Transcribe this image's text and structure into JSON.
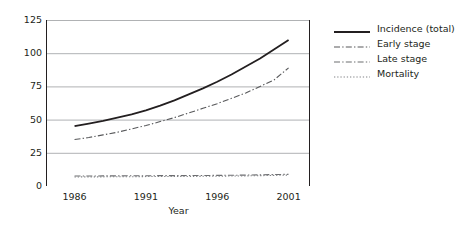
{
  "chart_data": {
    "type": "line",
    "title": "",
    "xlabel": "Year",
    "ylabel": "Rate per 100 000 population",
    "xlim": [
      1984,
      2002.5
    ],
    "ylim": [
      0,
      125
    ],
    "yticks": [
      0,
      25,
      50,
      75,
      100,
      125
    ],
    "ytick_labels": [
      "0",
      "25",
      "50",
      "75",
      "100",
      "125"
    ],
    "xticks": [
      1986,
      1991,
      1996,
      2001
    ],
    "xtick_labels": [
      "1986",
      "1991",
      "1996",
      "2001"
    ],
    "xminor_ticks": [
      1988.5,
      1993.5,
      1998.5
    ],
    "grid": "horizontal",
    "legend_position": "right",
    "x": [
      1986,
      1987,
      1988,
      1989,
      1990,
      1991,
      1992,
      1993,
      1994,
      1995,
      1996,
      1997,
      1998,
      1999,
      2000,
      2001
    ],
    "series": [
      {
        "name": "Incidence (total)",
        "style": "solid",
        "color": "#231f20",
        "values": [
          45,
          47,
          49,
          51.5,
          54,
          57,
          60.5,
          64.5,
          69,
          73.5,
          78.5,
          84,
          90,
          96,
          103,
          110
        ]
      },
      {
        "name": "Early stage",
        "style": "dash-dot",
        "color": "#58595b",
        "values": [
          35,
          36.5,
          38.5,
          40.5,
          43,
          45.5,
          48.5,
          51.5,
          55,
          58.5,
          62,
          66,
          70,
          75,
          80,
          89
        ]
      },
      {
        "name": "Late stage",
        "style": "dash-dot",
        "color": "#6d6e71",
        "values": [
          7.5,
          7.5,
          7.6,
          7.6,
          7.7,
          7.7,
          7.8,
          7.8,
          7.9,
          7.9,
          8.0,
          8.1,
          8.2,
          8.4,
          8.6,
          8.8
        ]
      },
      {
        "name": "Mortality",
        "style": "dotted",
        "color": "#808285",
        "values": [
          6.8,
          6.9,
          6.9,
          7.0,
          7.0,
          7.1,
          7.1,
          7.2,
          7.2,
          7.3,
          7.4,
          7.5,
          7.6,
          7.8,
          8.0,
          8.2
        ]
      }
    ]
  },
  "legend": {
    "items": [
      {
        "label": "Incidence (total)",
        "style": "solid"
      },
      {
        "label": "Early stage",
        "style": "dash-dot"
      },
      {
        "label": "Late stage",
        "style": "dash-dot"
      },
      {
        "label": "Mortality",
        "style": "dotted"
      }
    ]
  },
  "colors": {
    "axis": "#231f20",
    "grid": "#a7a9ac",
    "background": "#ffffff",
    "text": "#231f20"
  }
}
